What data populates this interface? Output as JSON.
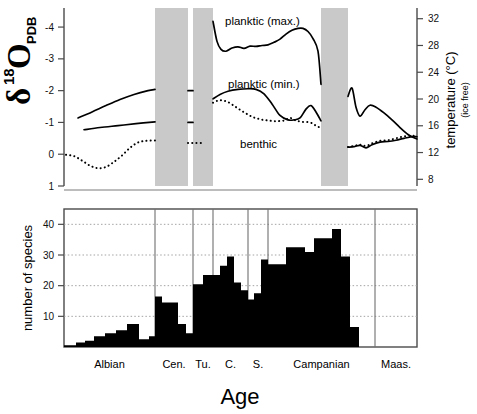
{
  "figure": {
    "width": 477,
    "height": 414,
    "background": "#ffffff",
    "band_color": "#c9c9c9",
    "bar_color": "#000000",
    "grid_color": "#9a9a9a",
    "axis_color": "#4a4a4a"
  },
  "top_panel": {
    "left_axis_title_main": "O",
    "left_axis_title_delta": "δ",
    "left_axis_title_sup": "18",
    "left_axis_title_sub": "PDB",
    "left_ticks": [
      "-4",
      "-3",
      "-2",
      "-1",
      "0",
      "1"
    ],
    "right_axis_title": "temperature (°C)",
    "right_axis_subtitle": "(ice free)",
    "right_ticks": [
      "32",
      "28",
      "24",
      "20",
      "16",
      "12",
      "8"
    ],
    "series_labels": {
      "planktic_max": "planktic (max.)",
      "planktic_min": "planktic (min.)",
      "benthic": "benthic"
    }
  },
  "bottom_panel": {
    "y_axis_title": "number of species",
    "x_axis_title": "Age",
    "y_ticks": [
      "10",
      "20",
      "30",
      "40"
    ],
    "stages": [
      "Albian",
      "Cen.",
      "Tu.",
      "C.",
      "S.",
      "Campanian",
      "Maas."
    ]
  },
  "chart_data": [
    {
      "type": "line",
      "id": "oxygen-isotope-temperature",
      "title": "",
      "xlabel": "Age",
      "ylabel": "δ18O PDB",
      "ylabel_right": "temperature (°C) (ice free)",
      "ylim": [
        1,
        -4.6
      ],
      "ylim_right": [
        7,
        33.6
      ],
      "yticks": [
        -4,
        -3,
        -2,
        -1,
        0,
        1
      ],
      "yticks_right": [
        32,
        28,
        24,
        20,
        16,
        12,
        8
      ],
      "grid": false,
      "legend": "inline-labels",
      "shaded_bands": [
        {
          "x0": 155,
          "x1": 188
        },
        {
          "x0": 193,
          "x1": 213
        },
        {
          "x0": 321,
          "x1": 348
        }
      ],
      "series": [
        {
          "name": "planktic (max.)",
          "style": "solid",
          "points": [
            [
              213,
              -4.18
            ],
            [
              217,
              -3.55
            ],
            [
              221,
              -3.3
            ],
            [
              226,
              -3.24
            ],
            [
              232,
              -3.34
            ],
            [
              238,
              -3.38
            ],
            [
              244,
              -3.33
            ],
            [
              250,
              -3.4
            ],
            [
              256,
              -3.39
            ],
            [
              262,
              -3.42
            ],
            [
              268,
              -3.44
            ],
            [
              274,
              -3.52
            ],
            [
              280,
              -3.62
            ],
            [
              286,
              -3.78
            ],
            [
              292,
              -3.9
            ],
            [
              298,
              -3.96
            ],
            [
              303,
              -3.96
            ],
            [
              308,
              -3.86
            ],
            [
              313,
              -3.64
            ],
            [
              318,
              -3.24
            ],
            [
              321,
              -2.2
            ]
          ]
        },
        {
          "name": "planktic (min.) - segment 1",
          "style": "solid",
          "points": [
            [
              78,
              -1.14
            ],
            [
              92,
              -1.33
            ],
            [
              106,
              -1.53
            ],
            [
              120,
              -1.72
            ],
            [
              134,
              -1.88
            ],
            [
              148,
              -2.0
            ],
            [
              155,
              -2.04
            ]
          ]
        },
        {
          "name": "planktic (min.) - segment 2",
          "style": "solid",
          "points": [
            [
              188,
              -2.0
            ],
            [
              193,
              -2.0
            ]
          ]
        },
        {
          "name": "planktic (min.) - segment 3",
          "style": "solid",
          "points": [
            [
              213,
              -1.74
            ],
            [
              220,
              -1.88
            ],
            [
              228,
              -1.98
            ],
            [
              238,
              -2.04
            ],
            [
              248,
              -2.06
            ],
            [
              256,
              -2.04
            ],
            [
              264,
              -1.9
            ],
            [
              272,
              -1.58
            ],
            [
              280,
              -1.22
            ],
            [
              288,
              -1.08
            ],
            [
              294,
              -1.08
            ],
            [
              300,
              -1.14
            ],
            [
              306,
              -1.42
            ],
            [
              311,
              -1.53
            ],
            [
              316,
              -1.33
            ],
            [
              321,
              -1.05
            ]
          ]
        },
        {
          "name": "planktic (min.) - segment 4",
          "style": "solid",
          "points": [
            [
              348,
              -1.82
            ],
            [
              352,
              -2.08
            ],
            [
              356,
              -1.48
            ],
            [
              360,
              -1.2
            ],
            [
              365,
              -1.4
            ],
            [
              370,
              -1.54
            ],
            [
              376,
              -1.48
            ],
            [
              384,
              -1.3
            ],
            [
              392,
              -1.08
            ],
            [
              400,
              -0.84
            ],
            [
              408,
              -0.62
            ],
            [
              414,
              -0.52
            ],
            [
              417,
              -0.48
            ]
          ]
        },
        {
          "name": "planktic-low - segment 1",
          "style": "solid",
          "points": [
            [
              84,
              -0.77
            ],
            [
              100,
              -0.84
            ],
            [
              118,
              -0.9
            ],
            [
              136,
              -0.96
            ],
            [
              155,
              -1.02
            ]
          ]
        },
        {
          "name": "planktic-low - segment 2",
          "style": "solid",
          "points": [
            [
              188,
              -1.0
            ],
            [
              193,
              -1.0
            ]
          ]
        },
        {
          "name": "benthic - segment 1",
          "style": "dotted",
          "points": [
            [
              66,
              0.02
            ],
            [
              74,
              0.06
            ],
            [
              82,
              0.2
            ],
            [
              90,
              0.36
            ],
            [
              98,
              0.44
            ],
            [
              106,
              0.4
            ],
            [
              114,
              0.24
            ],
            [
              122,
              0.04
            ],
            [
              130,
              -0.2
            ],
            [
              138,
              -0.37
            ],
            [
              146,
              -0.42
            ],
            [
              155,
              -0.43
            ]
          ]
        },
        {
          "name": "benthic - segment 2",
          "style": "dotted",
          "points": [
            [
              188,
              -0.35
            ],
            [
              196,
              -0.35
            ],
            [
              203,
              -0.35
            ]
          ]
        },
        {
          "name": "benthic - segment 3",
          "style": "dotted",
          "points": [
            [
              213,
              -1.62
            ],
            [
              220,
              -1.7
            ],
            [
              228,
              -1.64
            ],
            [
              236,
              -1.48
            ],
            [
              244,
              -1.32
            ],
            [
              252,
              -1.18
            ],
            [
              260,
              -1.1
            ],
            [
              268,
              -1.06
            ],
            [
              276,
              -1.04
            ],
            [
              284,
              -1.06
            ],
            [
              290,
              -1.14
            ],
            [
              296,
              -1.06
            ],
            [
              302,
              -1.02
            ],
            [
              310,
              -1.0
            ],
            [
              316,
              -0.9
            ],
            [
              321,
              -0.82
            ]
          ]
        },
        {
          "name": "benthic - segment 4",
          "style": "dotted",
          "points": [
            [
              348,
              -0.23
            ],
            [
              354,
              -0.26
            ],
            [
              360,
              -0.3
            ],
            [
              366,
              -0.26
            ],
            [
              372,
              -0.34
            ],
            [
              380,
              -0.42
            ],
            [
              388,
              -0.44
            ],
            [
              396,
              -0.5
            ],
            [
              404,
              -0.56
            ],
            [
              412,
              -0.58
            ],
            [
              417,
              -0.58
            ]
          ]
        },
        {
          "name": "benthic-upper - segment 4",
          "style": "solid",
          "points": [
            [
              348,
              -0.22
            ],
            [
              354,
              -0.24
            ],
            [
              360,
              -0.28
            ],
            [
              366,
              -0.2
            ],
            [
              372,
              -0.3
            ],
            [
              380,
              -0.38
            ],
            [
              388,
              -0.4
            ],
            [
              396,
              -0.44
            ],
            [
              404,
              -0.5
            ],
            [
              412,
              -0.55
            ],
            [
              417,
              -0.55
            ]
          ]
        }
      ]
    },
    {
      "type": "bar",
      "id": "species-richness-histogram",
      "title": "",
      "xlabel": "Age",
      "ylabel": "number of species",
      "ylim": [
        0,
        45
      ],
      "yticks": [
        10,
        20,
        30,
        40
      ],
      "grid": true,
      "grid_style": "dotted-horizontal",
      "stage_boundaries_x": [
        155,
        193,
        213,
        248,
        268,
        375
      ],
      "stages": [
        "Albian",
        "Cen.",
        "Tu.",
        "C.",
        "S.",
        "Campanian",
        "Maas."
      ],
      "bar_count": 29,
      "values": [
        0.6,
        1.5,
        2.0,
        3.5,
        4.5,
        5.5,
        7.5,
        2.5,
        3.5,
        16.5,
        14.5,
        14.5,
        7.5,
        4.5,
        20.5,
        23.5,
        23.5,
        26.5,
        29.5,
        21.0,
        18.5,
        15.5,
        17.5,
        28.5,
        27.0,
        27.0,
        32.5,
        32.5,
        31.0,
        35.5,
        35.5,
        38.5,
        29.5,
        6.5
      ],
      "bar_edges_x": [
        64,
        76,
        85,
        94,
        105,
        116,
        127,
        139,
        149,
        155,
        162,
        170,
        178,
        186,
        193,
        203,
        213,
        220,
        227,
        234,
        241,
        248,
        254,
        261,
        268,
        277,
        286,
        295,
        305,
        314,
        323,
        332,
        341,
        350,
        359,
        368,
        375,
        385,
        417
      ]
    }
  ]
}
